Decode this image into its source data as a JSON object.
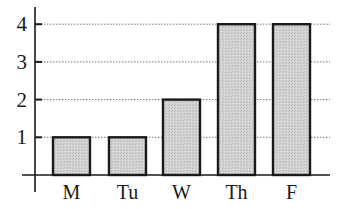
{
  "chart_data": {
    "type": "bar",
    "title": "",
    "xlabel": "",
    "ylabel": "",
    "categories": [
      "M",
      "Tu",
      "W",
      "Th",
      "F"
    ],
    "values": [
      1,
      1,
      2,
      4,
      4
    ],
    "ylim": [
      0,
      4
    ],
    "yticks": [
      1,
      2,
      3,
      4
    ],
    "grid": "horizontal dotted",
    "legend": "none",
    "colors": {
      "bar_fill": "#cfcfcf",
      "bar_stroke": "#1a1a1a",
      "axis": "#1a1a1a",
      "grid": "#777777"
    }
  }
}
